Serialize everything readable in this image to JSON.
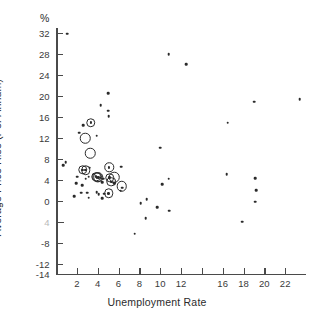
{
  "chart_data": {
    "type": "scatter",
    "title": "",
    "xlabel": "Unemployment Rate",
    "ylabel": "Average Price Rise (Per Annum)",
    "unit_label": "%",
    "xlim": [
      0,
      24
    ],
    "ylim": [
      -14,
      33
    ],
    "grid": false,
    "legend": "none",
    "xticks": [
      2,
      4,
      6,
      8,
      10,
      12,
      14,
      16,
      18,
      20,
      22
    ],
    "xtick_labels": [
      "2",
      "4",
      "6",
      "8",
      "10",
      "12",
      "",
      "16",
      "18",
      "20",
      "22"
    ],
    "yticks": [
      32,
      28,
      24,
      20,
      16,
      12,
      8,
      4,
      0,
      -4,
      -8,
      -12,
      -14
    ],
    "ytick_labels": [
      "32",
      "28",
      "24",
      "20",
      "16",
      "12",
      "8",
      "4",
      "0",
      "4",
      "-8",
      "-12",
      "-14"
    ],
    "series": [
      {
        "name": "plain-points",
        "marker": "dot",
        "points": [
          [
            1.05,
            31.9
          ],
          [
            10.8,
            28.0
          ],
          [
            12.5,
            26.1
          ],
          [
            5.0,
            20.5
          ],
          [
            4.3,
            18.3
          ],
          [
            5.0,
            17.2
          ],
          [
            5.05,
            16.2
          ],
          [
            16.5,
            14.9
          ],
          [
            19.0,
            18.9
          ],
          [
            23.4,
            19.4
          ],
          [
            2.6,
            14.4
          ],
          [
            2.25,
            13.0
          ],
          [
            3.9,
            12.4
          ],
          [
            10.0,
            10.1
          ],
          [
            0.95,
            7.4
          ],
          [
            0.7,
            6.8
          ],
          [
            6.25,
            6.5
          ],
          [
            3.25,
            6.3
          ],
          [
            16.4,
            5.1
          ],
          [
            10.8,
            4.2
          ],
          [
            19.1,
            4.3
          ],
          [
            2.05,
            4.6
          ],
          [
            2.85,
            4.2
          ],
          [
            3.15,
            4.6
          ],
          [
            4.3,
            4.4
          ],
          [
            4.55,
            4.2
          ],
          [
            1.95,
            3.3
          ],
          [
            2.5,
            3.0
          ],
          [
            4.45,
            3.5
          ],
          [
            5.6,
            3.4
          ],
          [
            6.35,
            2.5
          ],
          [
            6.2,
            1.9
          ],
          [
            10.2,
            3.1
          ],
          [
            19.2,
            2.0
          ],
          [
            2.4,
            1.5
          ],
          [
            3.0,
            1.55
          ],
          [
            3.9,
            1.6
          ],
          [
            4.1,
            1.3
          ],
          [
            4.6,
            1.35
          ],
          [
            1.75,
            0.9
          ],
          [
            3.15,
            0.6
          ],
          [
            4.45,
            0.45
          ],
          [
            8.7,
            0.3
          ],
          [
            19.15,
            -0.2
          ],
          [
            8.15,
            -0.5
          ],
          [
            9.7,
            -1.2
          ],
          [
            10.85,
            -1.9
          ],
          [
            8.6,
            -3.3
          ],
          [
            17.9,
            -4.0
          ],
          [
            7.55,
            -6.3
          ]
        ]
      },
      {
        "name": "open-circle-points",
        "marker": "ring",
        "points": [
          [
            2.8,
            11.9
          ],
          [
            3.3,
            9.1
          ],
          [
            6.3,
            2.8
          ],
          [
            5.6,
            4.5
          ]
        ]
      },
      {
        "name": "circled-points",
        "marker": "ringdot",
        "points": [
          [
            3.35,
            14.9
          ],
          [
            2.55,
            5.9
          ],
          [
            2.85,
            5.85
          ],
          [
            5.1,
            6.4
          ],
          [
            3.85,
            4.6
          ],
          [
            3.95,
            4.5
          ],
          [
            4.05,
            4.45
          ],
          [
            5.15,
            4.4
          ],
          [
            5.3,
            3.6
          ],
          [
            5.05,
            1.4
          ]
        ]
      }
    ]
  }
}
